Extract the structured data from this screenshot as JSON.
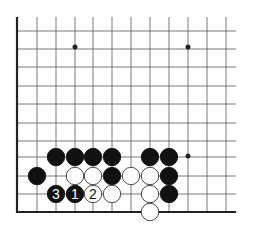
{
  "diagram": {
    "type": "go-board-fragment",
    "grid": {
      "columns_x": [
        17,
        37,
        56,
        75,
        93,
        112,
        131,
        150,
        169,
        188,
        207,
        226
      ],
      "rows_y": [
        31,
        49,
        67,
        86,
        104,
        123,
        141,
        157,
        176,
        194,
        212
      ],
      "top_y": 17,
      "right_x": 236,
      "left_edge_x": 17,
      "bottom_edge_y": 212
    },
    "star_points": [
      {
        "x": 75,
        "y": 47
      },
      {
        "x": 188,
        "y": 47
      },
      {
        "x": 188,
        "y": 156
      }
    ],
    "stones": [
      {
        "color": "black",
        "x": 56,
        "y": 157,
        "label": ""
      },
      {
        "color": "black",
        "x": 75,
        "y": 157,
        "label": ""
      },
      {
        "color": "black",
        "x": 93,
        "y": 157,
        "label": ""
      },
      {
        "color": "black",
        "x": 112,
        "y": 157,
        "label": ""
      },
      {
        "color": "black",
        "x": 150,
        "y": 157,
        "label": ""
      },
      {
        "color": "black",
        "x": 169,
        "y": 157,
        "label": ""
      },
      {
        "color": "black",
        "x": 37,
        "y": 176,
        "label": ""
      },
      {
        "color": "white",
        "x": 75,
        "y": 176,
        "label": ""
      },
      {
        "color": "white",
        "x": 93,
        "y": 176,
        "label": ""
      },
      {
        "color": "black",
        "x": 112,
        "y": 176,
        "label": ""
      },
      {
        "color": "white",
        "x": 131,
        "y": 176,
        "label": ""
      },
      {
        "color": "white",
        "x": 150,
        "y": 176,
        "label": ""
      },
      {
        "color": "black",
        "x": 169,
        "y": 176,
        "label": ""
      },
      {
        "color": "black",
        "x": 56,
        "y": 194,
        "label": "3"
      },
      {
        "color": "black",
        "x": 75,
        "y": 194,
        "label": "1"
      },
      {
        "color": "white",
        "x": 93,
        "y": 194,
        "label": "2"
      },
      {
        "color": "white",
        "x": 112,
        "y": 194,
        "label": ""
      },
      {
        "color": "white",
        "x": 150,
        "y": 194,
        "label": ""
      },
      {
        "color": "black",
        "x": 169,
        "y": 194,
        "label": ""
      },
      {
        "color": "white",
        "x": 150,
        "y": 212,
        "label": ""
      }
    ],
    "colors": {
      "line": "#555555",
      "edge": "#222222",
      "black_stone": "#111111",
      "white_stone": "#ffffff",
      "stone_outline": "#333333"
    }
  }
}
